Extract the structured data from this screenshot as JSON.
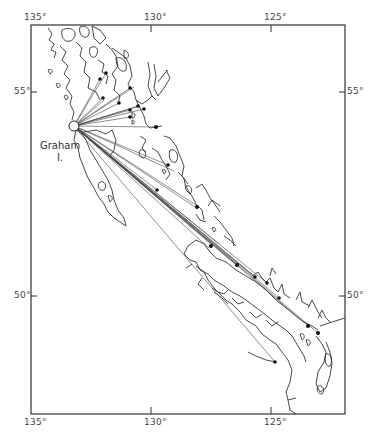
{
  "map": {
    "type": "radiating-lines map",
    "origin": {
      "label": "Graham",
      "sublabel": "I.",
      "x": 74,
      "y": 126
    },
    "frame": {
      "left": 31,
      "top": 25,
      "right": 345,
      "bottom": 414
    },
    "longitude_ticks": [
      {
        "label": "135°",
        "x": 31
      },
      {
        "label": "130°",
        "x": 151
      },
      {
        "label": "125°",
        "x": 271
      }
    ],
    "latitude_ticks": [
      {
        "label": "55°",
        "y": 92
      },
      {
        "label": "50°",
        "y": 296
      }
    ],
    "destinations": [
      [
        103,
        98
      ],
      [
        104,
        100
      ],
      [
        119,
        103
      ],
      [
        130,
        88
      ],
      [
        134,
        87
      ],
      [
        100,
        79
      ],
      [
        106,
        73
      ],
      [
        138,
        106
      ],
      [
        140,
        106
      ],
      [
        144,
        109
      ],
      [
        130,
        110
      ],
      [
        130,
        117
      ],
      [
        154,
        127
      ],
      [
        157,
        126
      ],
      [
        168,
        165
      ],
      [
        174,
        171
      ],
      [
        195,
        207
      ],
      [
        199,
        207
      ],
      [
        209,
        248
      ],
      [
        213,
        246
      ],
      [
        219,
        244
      ],
      [
        235,
        264
      ],
      [
        239,
        266
      ],
      [
        253,
        275
      ],
      [
        256,
        278
      ],
      [
        267,
        283
      ],
      [
        279,
        298
      ],
      [
        308,
        326
      ],
      [
        318,
        333
      ],
      [
        275,
        362
      ],
      [
        157,
        190
      ],
      [
        156,
        188
      ]
    ]
  }
}
